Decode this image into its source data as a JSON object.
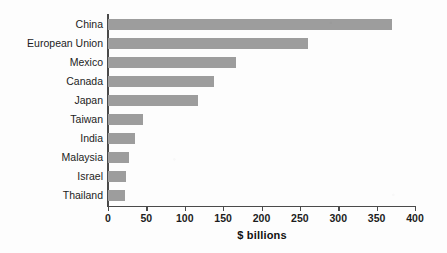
{
  "chart_data": {
    "type": "bar",
    "orientation": "horizontal",
    "title": "",
    "subtitle": "",
    "xlabel": "$ billions",
    "ylabel": "",
    "categories": [
      "China",
      "European Union",
      "Mexico",
      "Canada",
      "Japan",
      "Taiwan",
      "India",
      "Malaysia",
      "Israel",
      "Thailand"
    ],
    "values": [
      370,
      261,
      167,
      138,
      117,
      46,
      35,
      27,
      24,
      22
    ],
    "xlim": [
      0,
      400
    ],
    "xticks": [
      0,
      50,
      100,
      150,
      200,
      250,
      300,
      350,
      400
    ],
    "xtick_labels": [
      "0",
      "50",
      "100",
      "150",
      "200",
      "250",
      "300",
      "350",
      "400"
    ],
    "grid": false,
    "legend": null,
    "bar_color": "#9d9d9d",
    "axis_color": "#4a4a4a",
    "background_color": "#fdfdfd",
    "text_color": "#1c1c1c"
  }
}
